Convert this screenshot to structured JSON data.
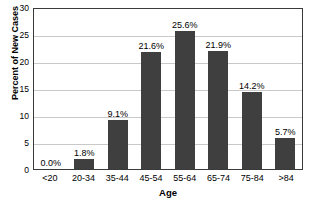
{
  "chart_data": {
    "type": "bar",
    "title": "",
    "xlabel": "Age",
    "ylabel": "Percent of New Cases",
    "categories": [
      "<20",
      "20-34",
      "35-44",
      "45-54",
      "55-64",
      "65-74",
      "75-84",
      ">84"
    ],
    "values": [
      0.0,
      1.8,
      9.1,
      21.6,
      25.6,
      21.9,
      14.2,
      5.7
    ],
    "data_labels": [
      "0.0%",
      "1.8%",
      "9.1%",
      "21.6%",
      "25.6%",
      "21.9%",
      "14.2%",
      "5.7%"
    ],
    "ylim": [
      0,
      30
    ],
    "ytick_labels": [
      "0",
      "5",
      "10",
      "15",
      "20",
      "25",
      "30"
    ],
    "ytick_values": [
      0,
      5,
      10,
      15,
      20,
      25,
      30
    ],
    "grid": true,
    "legend": "none",
    "bar_color": "#3f3f3f",
    "gridline_color": "#c9c9c9",
    "axis_color": "#3a3a3a",
    "background_color": "#ffffff"
  }
}
